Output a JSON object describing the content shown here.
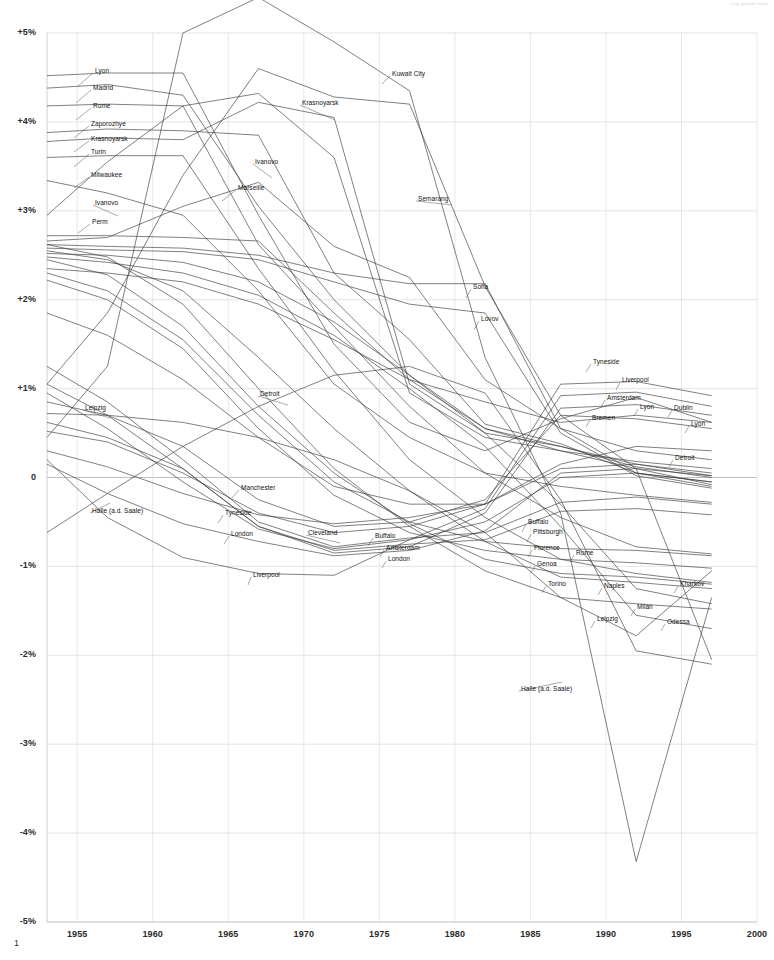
{
  "meta": {
    "corner_note": "City growth rates",
    "page_number": "1"
  },
  "chart_data": {
    "type": "line",
    "title": "",
    "subtitle": "",
    "xlabel": "",
    "ylabel": "",
    "xlim": [
      1953,
      2000
    ],
    "ylim": [
      -5,
      5
    ],
    "grid": true,
    "legend": "inline-labels",
    "x_ticks": [
      "1955",
      "1960",
      "1965",
      "1970",
      "1975",
      "1980",
      "1985",
      "1990",
      "1995",
      "2000"
    ],
    "x_tick_values": [
      1955,
      1960,
      1965,
      1970,
      1975,
      1980,
      1985,
      1990,
      1995,
      2000
    ],
    "y_ticks": [
      "+5%",
      "+4%",
      "+3%",
      "+2%",
      "+1%",
      "0",
      "-1%",
      "-2%",
      "-3%",
      "-4%",
      "-5%"
    ],
    "y_tick_values": [
      5,
      4,
      3,
      2,
      1,
      0,
      -1,
      -2,
      -3,
      -4,
      -5
    ],
    "x": [
      1953,
      1957,
      1962,
      1967,
      1972,
      1977,
      1982,
      1987,
      1992,
      1997
    ],
    "series": [
      {
        "name": "Lyon",
        "values": [
          4.52,
          4.55,
          4.55,
          2.95,
          1.5,
          0.62,
          0.3,
          0.66,
          0.9,
          0.62
        ]
      },
      {
        "name": "Madrid",
        "values": [
          4.38,
          4.42,
          4.3,
          3.05,
          2.0,
          1.15,
          0.55,
          0.3,
          0.18,
          0.1
        ]
      },
      {
        "name": "Rome",
        "values": [
          4.18,
          4.2,
          4.18,
          2.62,
          1.7,
          0.8,
          0.05,
          -0.45,
          -0.78,
          -0.86
        ]
      },
      {
        "name": "Zaporozhye",
        "values": [
          3.88,
          3.92,
          3.9,
          3.85,
          2.3,
          1.55,
          0.6,
          0.38,
          0.05,
          -0.05
        ]
      },
      {
        "name": "Krasnoyarsk",
        "values": [
          3.78,
          3.82,
          3.8,
          4.22,
          4.05,
          1.05,
          0.5,
          0.35,
          0.12,
          0.0
        ]
      },
      {
        "name": "Turin",
        "values": [
          3.6,
          3.62,
          3.62,
          2.35,
          1.2,
          0.2,
          -0.45,
          -0.92,
          -1.08,
          -1.18
        ]
      },
      {
        "name": "Milwaukee",
        "values": [
          3.34,
          3.2,
          2.95,
          2.1,
          1.05,
          0.45,
          0.05,
          -0.1,
          -0.2,
          -0.28
        ]
      },
      {
        "name": "Ivanovo",
        "values": [
          2.95,
          3.55,
          4.18,
          4.32,
          3.6,
          0.95,
          0.45,
          0.3,
          0.1,
          -0.08
        ]
      },
      {
        "name": "Marseille",
        "values": [
          2.66,
          2.7,
          3.05,
          3.32,
          2.6,
          2.25,
          1.1,
          0.55,
          0.3,
          0.2
        ]
      },
      {
        "name": "Perm",
        "values": [
          2.72,
          2.72,
          2.7,
          2.66,
          1.85,
          1.1,
          0.55,
          0.35,
          0.15,
          0.02
        ]
      },
      {
        "name": "Kuwait City",
        "values": [
          0.45,
          1.25,
          5.0,
          5.4,
          4.9,
          4.35,
          1.35,
          -0.4,
          -4.32,
          -1.35
        ]
      },
      {
        "name": "Semarang",
        "values": [
          1.05,
          1.85,
          3.4,
          4.6,
          4.28,
          4.2,
          2.15,
          0.7,
          0.1,
          -2.05
        ]
      },
      {
        "name": "Sofia",
        "values": [
          2.62,
          2.6,
          2.58,
          2.5,
          2.3,
          2.18,
          2.18,
          0.55,
          0.05,
          -0.1
        ]
      },
      {
        "name": "Lovov",
        "values": [
          2.58,
          2.56,
          2.54,
          2.45,
          2.2,
          1.95,
          1.85,
          0.5,
          0.02,
          -0.12
        ]
      },
      {
        "name": "Tyneside",
        "values": [
          0.52,
          0.4,
          0.05,
          -0.4,
          -0.62,
          -0.55,
          -0.3,
          1.05,
          1.08,
          0.92
        ]
      },
      {
        "name": "Liverpool",
        "values": [
          0.2,
          -0.45,
          -0.9,
          -1.08,
          -1.1,
          -0.7,
          -0.35,
          0.92,
          0.96,
          0.8
        ]
      },
      {
        "name": "Amsterdam",
        "values": [
          0.62,
          0.45,
          0.1,
          -0.55,
          -0.85,
          -0.78,
          -0.4,
          0.78,
          0.82,
          0.7
        ]
      },
      {
        "name": "Bremen",
        "values": [
          0.85,
          0.7,
          0.35,
          -0.25,
          -0.55,
          -0.5,
          -0.25,
          0.7,
          0.66,
          0.55
        ]
      },
      {
        "name": "Dublin",
        "values": [
          2.35,
          2.3,
          2.2,
          1.95,
          1.55,
          1.1,
          0.85,
          0.62,
          0.7,
          0.62
        ]
      },
      {
        "name": "Detroit",
        "values": [
          1.85,
          1.6,
          1.1,
          0.45,
          -0.1,
          -0.3,
          -0.3,
          0.15,
          0.35,
          0.3
        ]
      },
      {
        "name": "Manchester",
        "values": [
          0.3,
          0.12,
          -0.18,
          -0.42,
          -0.52,
          -0.45,
          -0.3,
          0.1,
          0.15,
          0.05
        ]
      },
      {
        "name": "London",
        "values": [
          0.15,
          -0.18,
          -0.52,
          -0.72,
          -0.88,
          -0.82,
          -0.6,
          0.05,
          0.1,
          0.02
        ]
      },
      {
        "name": "Cleveland",
        "values": [
          0.95,
          0.55,
          -0.05,
          -0.58,
          -0.8,
          -0.7,
          -0.5,
          0.0,
          0.05,
          -0.05
        ]
      },
      {
        "name": "Buffalo",
        "values": [
          1.25,
          0.85,
          0.2,
          -0.5,
          -0.78,
          -0.68,
          -0.62,
          -0.28,
          -0.22,
          -0.3
        ]
      },
      {
        "name": "Pittsburgh",
        "values": [
          1.05,
          0.7,
          0.1,
          -0.55,
          -0.82,
          -0.75,
          -0.7,
          -0.38,
          -0.35,
          -0.42
        ]
      },
      {
        "name": "Florence",
        "values": [
          2.3,
          2.1,
          1.55,
          0.7,
          -0.05,
          -0.5,
          -0.72,
          -0.8,
          -0.82,
          -0.88
        ]
      },
      {
        "name": "Genoa",
        "values": [
          2.22,
          2.0,
          1.45,
          0.55,
          -0.2,
          -0.62,
          -0.82,
          -0.92,
          -0.96,
          -1.02
        ]
      },
      {
        "name": "Torino",
        "values": [
          2.45,
          2.28,
          1.7,
          0.8,
          0.05,
          -0.52,
          -0.92,
          -1.08,
          -1.12,
          -1.2
        ]
      },
      {
        "name": "Naples",
        "values": [
          2.55,
          2.45,
          2.1,
          1.35,
          0.55,
          -0.15,
          -0.72,
          -1.12,
          -1.18,
          -1.25
        ]
      },
      {
        "name": "Milan",
        "values": [
          2.62,
          2.48,
          1.95,
          1.0,
          0.1,
          -0.55,
          -1.05,
          -1.35,
          -1.42,
          -1.48
        ]
      },
      {
        "name": "Leipzig",
        "values": [
          0.72,
          0.7,
          0.62,
          0.45,
          0.2,
          -0.15,
          -0.62,
          -1.35,
          -1.78,
          -1.05
        ]
      },
      {
        "name": "Odessa",
        "values": [
          2.48,
          2.42,
          2.3,
          2.05,
          1.6,
          1.0,
          0.35,
          -0.55,
          -1.55,
          -1.7
        ]
      },
      {
        "name": "Kharkov",
        "values": [
          2.52,
          2.5,
          2.42,
          2.2,
          1.75,
          1.15,
          0.5,
          -0.3,
          -1.25,
          -1.42
        ]
      },
      {
        "name": "Halle (a.d. Saale)",
        "values": [
          -0.62,
          -0.18,
          0.35,
          0.8,
          1.15,
          1.25,
          0.95,
          -0.25,
          -1.95,
          -2.1
        ]
      }
    ],
    "label_annotations": [
      {
        "text": "Lyon",
        "x": 95,
        "y": 72,
        "lx": 78,
        "ly": 86
      },
      {
        "text": "Madrid",
        "x": 93,
        "y": 89,
        "lx": 76,
        "ly": 103
      },
      {
        "text": "Rome",
        "x": 93,
        "y": 107,
        "lx": 76,
        "ly": 120
      },
      {
        "text": "Zaporozhye",
        "x": 91,
        "y": 125,
        "lx": 74,
        "ly": 138
      },
      {
        "text": "Krasnoyarsk",
        "x": 91,
        "y": 140,
        "lx": 74,
        "ly": 152
      },
      {
        "text": "Turin",
        "x": 91,
        "y": 153,
        "lx": 74,
        "ly": 167
      },
      {
        "text": "Milwaukee",
        "x": 91,
        "y": 176,
        "lx": 74,
        "ly": 188
      },
      {
        "text": "Ivanovo",
        "x": 95,
        "y": 204,
        "lx": 118,
        "ly": 216
      },
      {
        "text": "Perm",
        "x": 92,
        "y": 223,
        "lx": 78,
        "ly": 233
      },
      {
        "text": "Ivanovo",
        "x": 255,
        "y": 163,
        "lx": 272,
        "ly": 178
      },
      {
        "text": "Marseille",
        "x": 238,
        "y": 189,
        "lx": 222,
        "ly": 201
      },
      {
        "text": "Krasnoyarsk",
        "x": 302,
        "y": 104,
        "lx": 335,
        "ly": 120
      },
      {
        "text": "Kuwait City",
        "x": 392,
        "y": 75,
        "lx": 382,
        "ly": 84
      },
      {
        "text": "Semarang",
        "x": 418,
        "y": 200,
        "lx": 452,
        "ly": 205
      },
      {
        "text": "Sofia",
        "x": 473,
        "y": 288,
        "lx": 466,
        "ly": 298
      },
      {
        "text": "Lovov",
        "x": 481,
        "y": 320,
        "lx": 474,
        "ly": 330
      },
      {
        "text": "Detroit",
        "x": 260,
        "y": 395,
        "lx": 288,
        "ly": 405
      },
      {
        "text": "Manchester",
        "x": 241,
        "y": 489,
        "lx": 232,
        "ly": 498
      },
      {
        "text": "Tyneside",
        "x": 225,
        "y": 514,
        "lx": 218,
        "ly": 523
      },
      {
        "text": "London",
        "x": 231,
        "y": 535,
        "lx": 224,
        "ly": 544
      },
      {
        "text": "Cleveland",
        "x": 308,
        "y": 534,
        "lx": 340,
        "ly": 543
      },
      {
        "text": "Liverpool",
        "x": 253,
        "y": 576,
        "lx": 248,
        "ly": 585
      },
      {
        "text": "Buffalo",
        "x": 375,
        "y": 537,
        "lx": 368,
        "ly": 546
      },
      {
        "text": "Amsterdam",
        "x": 386,
        "y": 549,
        "lx": 380,
        "ly": 557
      },
      {
        "text": "London",
        "x": 388,
        "y": 560,
        "lx": 382,
        "ly": 568
      },
      {
        "text": "Buffalo",
        "x": 528,
        "y": 523,
        "lx": 522,
        "ly": 532
      },
      {
        "text": "Pittsburgh",
        "x": 533,
        "y": 533,
        "lx": 527,
        "ly": 542
      },
      {
        "text": "Florence",
        "x": 534,
        "y": 549,
        "lx": 528,
        "ly": 557
      },
      {
        "text": "Rome",
        "x": 576,
        "y": 554,
        "lx": 570,
        "ly": 562
      },
      {
        "text": "Genoa",
        "x": 537,
        "y": 565,
        "lx": 531,
        "ly": 573
      },
      {
        "text": "Torino",
        "x": 548,
        "y": 585,
        "lx": 542,
        "ly": 593
      },
      {
        "text": "Naples",
        "x": 604,
        "y": 587,
        "lx": 598,
        "ly": 595
      },
      {
        "text": "Milan",
        "x": 637,
        "y": 608,
        "lx": 631,
        "ly": 616
      },
      {
        "text": "Leipzig",
        "x": 597,
        "y": 620,
        "lx": 591,
        "ly": 628
      },
      {
        "text": "Kharkov",
        "x": 680,
        "y": 585,
        "lx": 674,
        "ly": 593
      },
      {
        "text": "Odessa",
        "x": 667,
        "y": 623,
        "lx": 661,
        "ly": 631
      },
      {
        "text": "Tyneside",
        "x": 593,
        "y": 363,
        "lx": 586,
        "ly": 372
      },
      {
        "text": "Liverpool",
        "x": 622,
        "y": 381,
        "lx": 616,
        "ly": 390
      },
      {
        "text": "Amsterdam",
        "x": 607,
        "y": 399,
        "lx": 601,
        "ly": 407
      },
      {
        "text": "Lyon",
        "x": 640,
        "y": 408,
        "lx": 634,
        "ly": 416
      },
      {
        "text": "Dublin",
        "x": 674,
        "y": 409,
        "lx": 668,
        "ly": 417
      },
      {
        "text": "Bremen",
        "x": 592,
        "y": 419,
        "lx": 586,
        "ly": 427
      },
      {
        "text": "Lyon",
        "x": 691,
        "y": 425,
        "lx": 685,
        "ly": 433
      },
      {
        "text": "Detroit",
        "x": 675,
        "y": 459,
        "lx": 669,
        "ly": 467
      },
      {
        "text": "Leipzig",
        "x": 85,
        "y": 409,
        "lx": 110,
        "ly": 418
      },
      {
        "text": "Halle (a.d. Saale)",
        "x": 92,
        "y": 512,
        "lx": 110,
        "ly": 503
      },
      {
        "text": "Halle (a.d. Saale)",
        "x": 521,
        "y": 690,
        "lx": 562,
        "ly": 682
      }
    ]
  }
}
